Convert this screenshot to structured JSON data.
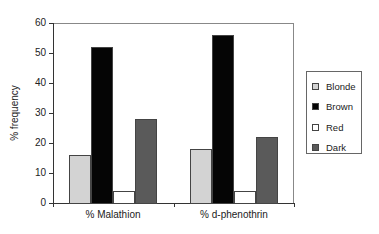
{
  "chart_data": {
    "type": "bar",
    "title": "",
    "xlabel": "",
    "ylabel": "% frequency",
    "ylim": [
      0,
      60
    ],
    "yticks": [
      0,
      10,
      20,
      30,
      40,
      50,
      60
    ],
    "categories": [
      "% Malathion",
      "% d-phenothrin"
    ],
    "series": [
      {
        "name": "Blonde",
        "color": "#d3d3d3",
        "values": [
          16,
          18
        ]
      },
      {
        "name": "Brown",
        "color": "#050505",
        "values": [
          52,
          56
        ]
      },
      {
        "name": "Red",
        "color": "#ffffff",
        "values": [
          4,
          4
        ]
      },
      {
        "name": "Dark",
        "color": "#5a5a5a",
        "values": [
          28,
          22
        ]
      }
    ],
    "grid": false,
    "legend_position": "right"
  }
}
